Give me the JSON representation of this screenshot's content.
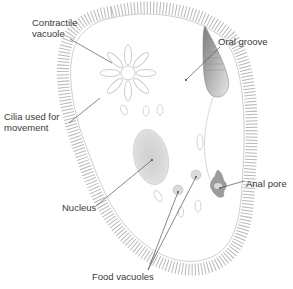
{
  "diagram": {
    "colors": {
      "background": "#ffffff",
      "outline": "#c8c8c8",
      "cilia": "#b5b5b5",
      "organelle_fill": "#d9d9d9",
      "organelle_dark": "#9a9a9a",
      "leader_line": "#555555",
      "label_text": "#3a3a3a"
    },
    "labels": [
      {
        "id": "contractile-vacuole",
        "text": "Contractile\nvacuole",
        "x": 32,
        "y": 17
      },
      {
        "id": "oral-groove",
        "text": "Oral groove",
        "x": 218,
        "y": 36
      },
      {
        "id": "cilia",
        "text": "Cilia used for\nmovement",
        "x": 4,
        "y": 111
      },
      {
        "id": "nucleus",
        "text": "Nucleus",
        "x": 62,
        "y": 202
      },
      {
        "id": "anal-pore",
        "text": "Anal pore",
        "x": 246,
        "y": 178
      },
      {
        "id": "food-vacuoles",
        "text": "Food vacuoles",
        "x": 92,
        "y": 271
      }
    ],
    "leader_lines": [
      {
        "id": "contractile-vacuole",
        "x1": 70,
        "y1": 39,
        "x2": 112,
        "y2": 63
      },
      {
        "id": "oral-groove",
        "x1": 220,
        "y1": 47,
        "x2": 186,
        "y2": 80
      },
      {
        "id": "cilia",
        "x1": 69,
        "y1": 123,
        "x2": 100,
        "y2": 98
      },
      {
        "id": "nucleus",
        "x1": 96,
        "y1": 206,
        "x2": 152,
        "y2": 160
      },
      {
        "id": "anal-pore",
        "x1": 244,
        "y1": 181,
        "x2": 220,
        "y2": 188
      },
      {
        "id": "food-vacuoles-1",
        "x1": 148,
        "y1": 270,
        "x2": 178,
        "y2": 192
      },
      {
        "id": "food-vacuoles-2",
        "x1": 148,
        "y1": 270,
        "x2": 196,
        "y2": 177
      }
    ]
  }
}
